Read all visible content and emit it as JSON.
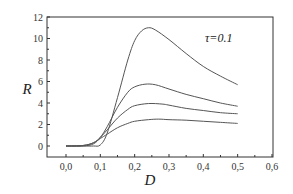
{
  "chart_data": {
    "type": "line",
    "title": "",
    "xlabel": "D",
    "ylabel": "R",
    "xlim": [
      -0.05,
      0.6
    ],
    "ylim": [
      -1,
      12
    ],
    "xticks": [
      0.0,
      0.1,
      0.2,
      0.3,
      0.4,
      0.5,
      0.6
    ],
    "xtick_labels": [
      "0,0",
      "0,1",
      "0,2",
      "0,3",
      "0,4",
      "0,5",
      "0,6"
    ],
    "yticks": [
      0,
      2,
      4,
      6,
      8,
      10,
      12
    ],
    "ytick_labels": [
      "0",
      "2",
      "4",
      "6",
      "8",
      "10",
      "12"
    ],
    "grid": false,
    "legend": null,
    "annotations": [
      {
        "text": "τ=0.1",
        "x": 0.47,
        "y": 10.0
      }
    ],
    "series": [
      {
        "name": "curve-1",
        "x": [
          0.0,
          0.05,
          0.08,
          0.1,
          0.12,
          0.15,
          0.18,
          0.2,
          0.22,
          0.24,
          0.26,
          0.3,
          0.35,
          0.4,
          0.45,
          0.5
        ],
        "values": [
          0,
          0,
          0,
          0.1,
          1.2,
          4.5,
          8.0,
          9.8,
          10.7,
          11.0,
          10.8,
          9.9,
          8.6,
          7.4,
          6.5,
          5.7
        ]
      },
      {
        "name": "curve-2",
        "x": [
          0.0,
          0.05,
          0.08,
          0.1,
          0.12,
          0.15,
          0.18,
          0.2,
          0.23,
          0.26,
          0.3,
          0.35,
          0.4,
          0.45,
          0.5
        ],
        "values": [
          0,
          0,
          0.2,
          0.8,
          1.8,
          3.6,
          5.0,
          5.5,
          5.75,
          5.7,
          5.3,
          4.8,
          4.4,
          4.0,
          3.7
        ]
      },
      {
        "name": "curve-3",
        "x": [
          0.0,
          0.05,
          0.08,
          0.1,
          0.12,
          0.15,
          0.18,
          0.2,
          0.24,
          0.28,
          0.3,
          0.35,
          0.4,
          0.45,
          0.5
        ],
        "values": [
          0,
          0.05,
          0.3,
          0.8,
          1.5,
          2.6,
          3.4,
          3.75,
          3.95,
          3.9,
          3.8,
          3.5,
          3.3,
          3.1,
          3.0
        ]
      },
      {
        "name": "curve-4",
        "x": [
          0.0,
          0.05,
          0.08,
          0.1,
          0.12,
          0.15,
          0.18,
          0.2,
          0.24,
          0.27,
          0.3,
          0.35,
          0.4,
          0.45,
          0.5
        ],
        "values": [
          0,
          0.05,
          0.3,
          0.7,
          1.1,
          1.7,
          2.1,
          2.3,
          2.45,
          2.5,
          2.45,
          2.4,
          2.3,
          2.2,
          2.1
        ]
      }
    ],
    "line_color": "#555555"
  },
  "plot": {
    "x_axis_label": "D",
    "y_axis_label": "R",
    "annotation": "τ=0.1"
  }
}
